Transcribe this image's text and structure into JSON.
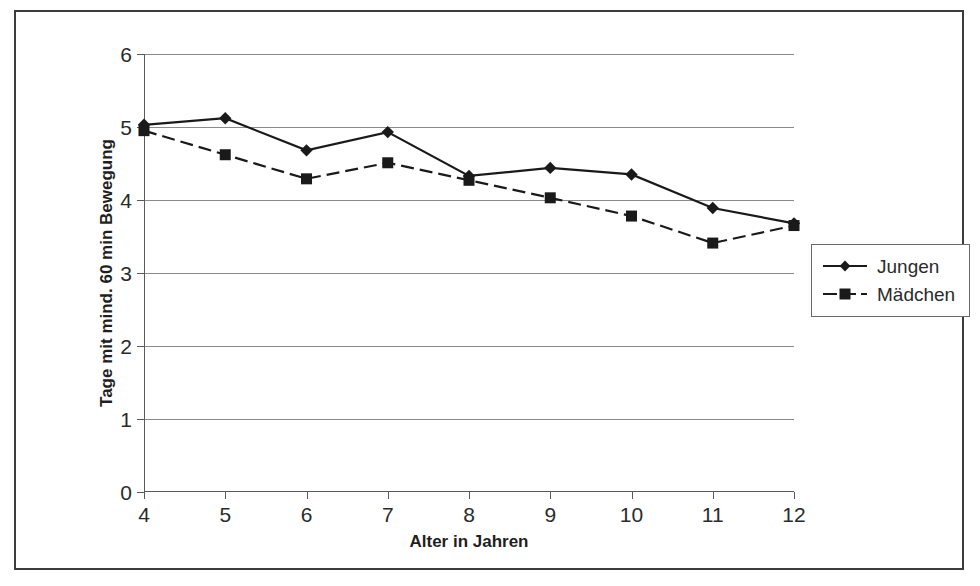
{
  "chart_data": {
    "type": "line",
    "title": "",
    "xlabel": "Alter in Jahren",
    "ylabel": "Tage mit mind. 60 min Bewegung",
    "categories": [
      4,
      5,
      6,
      7,
      8,
      9,
      10,
      11,
      12
    ],
    "x_tick_labels": [
      "4",
      "5",
      "6",
      "7",
      "8",
      "9",
      "10",
      "11",
      "12"
    ],
    "y_tick_labels": [
      "0",
      "1",
      "2",
      "3",
      "4",
      "5",
      "6"
    ],
    "y_ticks": [
      0,
      1,
      2,
      3,
      4,
      5,
      6
    ],
    "ylim": [
      0,
      6
    ],
    "xlim": [
      4,
      12
    ],
    "grid": "horizontal",
    "legend_position": "right",
    "series": [
      {
        "name": "Jungen",
        "marker": "diamond",
        "line_style": "solid",
        "color": "#1a1a1a",
        "values": [
          5.03,
          5.12,
          4.68,
          4.93,
          4.33,
          4.44,
          4.35,
          3.89,
          3.68
        ]
      },
      {
        "name": "Mädchen",
        "marker": "square",
        "line_style": "dashed",
        "color": "#1a1a1a",
        "values": [
          4.95,
          4.62,
          4.29,
          4.51,
          4.27,
          4.03,
          3.78,
          3.41,
          3.65
        ]
      }
    ]
  },
  "legend": {
    "items": [
      {
        "label": "Jungen"
      },
      {
        "label": "Mädchen"
      }
    ]
  },
  "colors": {
    "frame": "#3c3c3c",
    "grid": "#8a8a8a",
    "axis": "#5a5a5a",
    "ink": "#1a1a1a",
    "background": "#ffffff"
  }
}
